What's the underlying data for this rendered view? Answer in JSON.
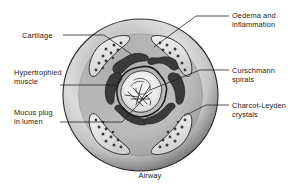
{
  "figure": {
    "caption": "Airway",
    "background_color": "#ffffff",
    "line_color": "#1a1a1a",
    "wall_outer_color": "#6e6e6e",
    "wall_mid_color": "#d8d8d8",
    "wall_inner_color": "#8a8a8a",
    "cartilage_color": "#e8e8e8",
    "muscle_color": "#3a3a3a",
    "lumen_color": "#f2f2f2"
  },
  "labels": {
    "cartilage": "Cartilage",
    "hypertrophied_muscle": "Hypertrophied\nmuscle",
    "mucus_plug": "Mucus plug\nin lumen",
    "oedema": "Oedema and\ninflammation",
    "curschmann": "Curschmann\nspirals",
    "charcot_leyden": "Charcot-Leyden\ncrystals"
  },
  "structures": [
    {
      "name": "airway-wall",
      "description": "outer circular wall with radial shading"
    },
    {
      "name": "cartilage-plate",
      "count": 4,
      "description": "pale crescent plates with chondrocyte dots"
    },
    {
      "name": "smooth-muscle-band",
      "description": "thick dark broken ring around lumen"
    },
    {
      "name": "lumen",
      "description": "narrowed star-shaped central lumen"
    },
    {
      "name": "mucus-plug",
      "description": "pale material filling lumen"
    },
    {
      "name": "curschmann-spiral",
      "description": "coiled strands within mucus"
    },
    {
      "name": "charcot-leyden-crystal",
      "description": "needle-shaped crystals within mucus"
    }
  ]
}
